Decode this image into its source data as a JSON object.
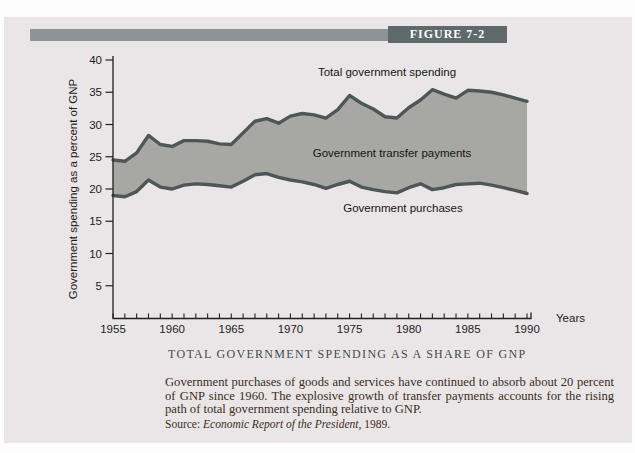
{
  "figure": {
    "label": "FIGURE 7-2"
  },
  "chart_data": {
    "type": "area",
    "title": "TOTAL GOVERNMENT SPENDING AS A SHARE OF GNP",
    "xlabel": "Years",
    "ylabel": "Government spending as a percent of GNP",
    "xlim": [
      1955,
      1990
    ],
    "ylim": [
      0,
      40
    ],
    "y_ticks": [
      5,
      10,
      15,
      20,
      25,
      30,
      35,
      40
    ],
    "x_tick_labels": [
      1955,
      1960,
      1965,
      1970,
      1975,
      1980,
      1985,
      1990
    ],
    "grid": "off",
    "legend": "labels drawn inside plot",
    "fill_label": "Government transfer payments",
    "x": [
      1955,
      1956,
      1957,
      1958,
      1959,
      1960,
      1961,
      1962,
      1963,
      1964,
      1965,
      1966,
      1967,
      1968,
      1969,
      1970,
      1971,
      1972,
      1973,
      1974,
      1975,
      1976,
      1977,
      1978,
      1979,
      1980,
      1981,
      1982,
      1983,
      1984,
      1985,
      1986,
      1987,
      1988,
      1989,
      1990
    ],
    "series": [
      {
        "name": "Total government spending",
        "values": [
          24.5,
          24.3,
          25.6,
          28.3,
          26.9,
          26.6,
          27.5,
          27.5,
          27.4,
          27.0,
          26.9,
          28.7,
          30.5,
          30.9,
          30.2,
          31.3,
          31.7,
          31.5,
          31.0,
          32.3,
          34.5,
          33.3,
          32.4,
          31.2,
          31.0,
          32.6,
          33.8,
          35.4,
          34.7,
          34.1,
          35.3,
          35.2,
          35.0,
          34.6,
          34.1,
          33.6
        ]
      },
      {
        "name": "Government purchases",
        "values": [
          19.0,
          18.8,
          19.6,
          21.4,
          20.3,
          20.0,
          20.6,
          20.8,
          20.7,
          20.5,
          20.3,
          21.2,
          22.2,
          22.4,
          21.8,
          21.4,
          21.1,
          20.7,
          20.1,
          20.7,
          21.2,
          20.3,
          19.9,
          19.6,
          19.4,
          20.2,
          20.8,
          19.9,
          20.2,
          20.7,
          20.8,
          20.9,
          20.6,
          20.2,
          19.8,
          19.3
        ]
      }
    ]
  },
  "description": "Government purchases of goods and services have continued to absorb about 20 percent of GNP since 1960. The explosive growth of transfer payments accounts for the rising path of total government spending relative to GNP.",
  "source": {
    "prefix": "Source:",
    "work": "Economic Report of the President,",
    "year": "1989."
  },
  "colors": {
    "panel_bg": "#eae6e7",
    "header_bar": "#8e9495",
    "figure_tag_bg": "#5e696b",
    "figure_tag_text": "#ffffff",
    "area_fill": "#a7a8a4",
    "series_line": "#4e5758",
    "axis": "#202020",
    "caption_text": "#3f4b4d",
    "body_text": "#3a2d22"
  }
}
